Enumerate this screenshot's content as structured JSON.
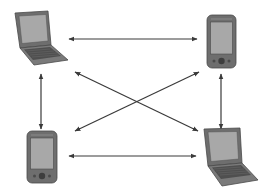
{
  "diagram": {
    "title": "",
    "colors": {
      "background": "#ffffff",
      "arrow": "#3a3a3a",
      "device_body": "#6e6e6e",
      "device_body_dark": "#555555",
      "screen": "#a8a8a8",
      "screen_border": "#4a4a4a",
      "keyboard": "#4f4f4f"
    },
    "nodes": [
      {
        "id": "laptop-top-left",
        "type": "laptop",
        "label": ""
      },
      {
        "id": "pda-top-right",
        "type": "pda",
        "label": ""
      },
      {
        "id": "pda-bottom-left",
        "type": "pda",
        "label": ""
      },
      {
        "id": "laptop-bottom-right",
        "type": "laptop",
        "label": ""
      }
    ],
    "edges": [
      {
        "from": "laptop-top-left",
        "to": "pda-top-right",
        "direction": "bidirectional"
      },
      {
        "from": "laptop-top-left",
        "to": "pda-bottom-left",
        "direction": "bidirectional"
      },
      {
        "from": "laptop-top-left",
        "to": "laptop-bottom-right",
        "direction": "bidirectional"
      },
      {
        "from": "pda-top-right",
        "to": "pda-bottom-left",
        "direction": "bidirectional"
      },
      {
        "from": "pda-top-right",
        "to": "laptop-bottom-right",
        "direction": "bidirectional"
      },
      {
        "from": "pda-bottom-left",
        "to": "laptop-bottom-right",
        "direction": "bidirectional"
      }
    ]
  }
}
